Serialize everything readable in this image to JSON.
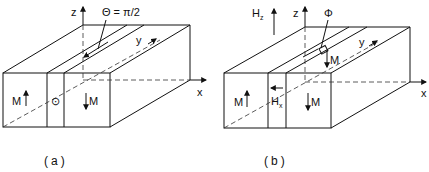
{
  "figure": {
    "panels": [
      {
        "id": "a",
        "caption": "(a)",
        "axes": {
          "z": "z",
          "y": "y",
          "x": "x"
        },
        "annotation": "Θ = π/2",
        "domains": [
          {
            "label": "M",
            "direction": "up"
          },
          {
            "label": "M",
            "direction": "down"
          }
        ],
        "wall_symbol": "⊙"
      },
      {
        "id": "b",
        "caption": "(b)",
        "axes": {
          "z": "z",
          "y": "y",
          "x": "x"
        },
        "field_z": "H",
        "field_z_sub": "z",
        "field_x": "H",
        "field_x_sub": "x",
        "angle": "Φ",
        "wall_M": "M",
        "domains": [
          {
            "label": "M",
            "direction": "up"
          },
          {
            "label": "M",
            "direction": "down"
          }
        ]
      }
    ]
  }
}
